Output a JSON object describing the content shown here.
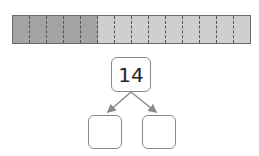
{
  "bar_model": {
    "total_segments": 14,
    "dark_segments": 5,
    "light_segments": 9,
    "colors": {
      "dark": "#a3a3a3",
      "light": "#cfcfcf",
      "border": "#6a6a6a"
    }
  },
  "number_bond": {
    "whole": "14",
    "parts": [
      "",
      ""
    ]
  }
}
